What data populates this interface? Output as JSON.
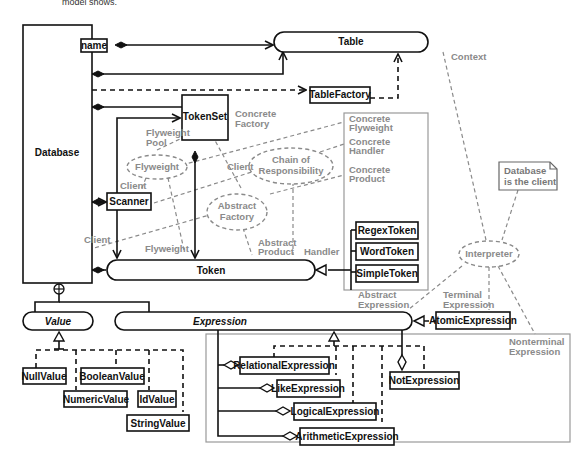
{
  "header": {
    "truncated_text": "model shows."
  },
  "classes": {
    "database": "Database",
    "table": "Table",
    "table_factory": "TableFactory",
    "token_set": "TokenSet",
    "scanner": "Scanner",
    "token": "Token",
    "regex_token": "RegexToken",
    "word_token": "WordToken",
    "simple_token": "SimpleToken",
    "value": "Value",
    "expression": "Expression",
    "atomic_expression": "AtomicExpression",
    "null_value": "NullValue",
    "boolean_value": "BooleanValue",
    "numeric_value": "NumericValue",
    "id_value": "IdValue",
    "string_value": "StringValue",
    "relational_expression": "RelationalExpression",
    "like_expression": "LikeExpression",
    "logical_expression": "LogicalExpression",
    "arithmetic_expression": "ArithmeticExpression",
    "not_expression": "NotExpression"
  },
  "qualifier": {
    "name": "name"
  },
  "patterns": {
    "flyweight": "Flyweight",
    "chain_1": "Chain of",
    "chain_2": "Responsibility",
    "abstract_factory_1": "Abstract",
    "abstract_factory_2": "Factory",
    "interpreter": "Interpreter"
  },
  "roles": {
    "context": "Context",
    "concrete_factory_1": "Concrete",
    "concrete_factory_2": "Factory",
    "flyweight_pool_1": "Flyweight",
    "flyweight_pool_2": "Pool",
    "client_scanner": "Client",
    "client_chain": "Client",
    "client_db": "Client",
    "flyweight_token": "Flyweight",
    "abstract_product_1": "Abstract",
    "abstract_product_2": "Product",
    "handler": "Handler",
    "concrete_flyweight_1": "Concrete",
    "concrete_flyweight_2": "Flyweight",
    "concrete_handler_1": "Concrete",
    "concrete_handler_2": "Handler",
    "concrete_product_1": "Concrete",
    "concrete_product_2": "Product",
    "abstract_expression_1": "Abstract",
    "abstract_expression_2": "Expression",
    "terminal_expression_1": "Terminal",
    "terminal_expression_2": "Expression",
    "nonterminal_expression_1": "Nonterminal",
    "nonterminal_expression_2": "Expression"
  },
  "note": {
    "line1": "Database",
    "line2": "is the client"
  }
}
